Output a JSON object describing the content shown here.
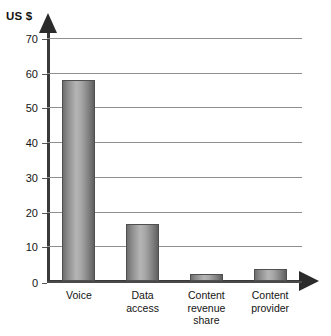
{
  "chart_data": {
    "type": "bar",
    "title": "",
    "subtitle": "",
    "xlabel": "",
    "ylabel": "US $",
    "ylim": [
      0,
      70
    ],
    "ytick_step": 10,
    "yticks": [
      "70",
      "60",
      "50",
      "40",
      "30",
      "20",
      "10",
      "0"
    ],
    "grid": true,
    "legend": false,
    "legend_position": "none",
    "categories": [
      "Voice",
      "Data access",
      "Content revenue share",
      "Content provider"
    ],
    "category_lines": [
      [
        "Voice"
      ],
      [
        "Data",
        "access"
      ],
      [
        "Content",
        "revenue",
        "share"
      ],
      [
        "Content",
        "provider"
      ]
    ],
    "values": [
      58,
      16.5,
      2,
      3.5
    ],
    "series": [
      {
        "name": "US $",
        "values": [
          58,
          16.5,
          2,
          3.5
        ]
      }
    ],
    "bar_style": "cylinder-gradient-grey",
    "colors": {
      "bar_light": "#b4b4b4",
      "bar_dark": "#5f5f5f",
      "bar_outline": "#4f4f4f",
      "axis": "#3a3a3a",
      "gridline": "#8f8f8f",
      "text": "#141414",
      "background": "#ffffff"
    }
  },
  "axis": {
    "y_title": "US $",
    "y_arrow_icon": "arrow-up-icon",
    "x_arrow_icon": "arrow-right-icon"
  }
}
